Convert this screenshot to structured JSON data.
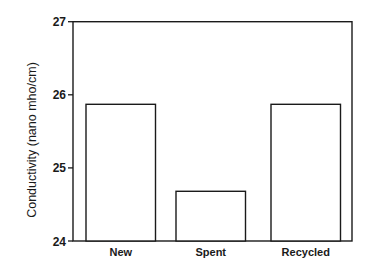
{
  "chart_data": {
    "type": "bar",
    "title": "",
    "xlabel": "",
    "ylabel": "Conductivity (nano mho/cm)",
    "categories": [
      "New",
      "Spent",
      "Recycled"
    ],
    "values": [
      25.87,
      24.68,
      25.87
    ],
    "ylim": [
      24,
      27
    ],
    "yticks": [
      24,
      25,
      26,
      27
    ],
    "ytick_labels": [
      "24",
      "25",
      "26",
      "27"
    ],
    "grid": false,
    "legend": null,
    "bar_fill": "#ffffff",
    "bar_stroke": "#1a1a1a"
  }
}
